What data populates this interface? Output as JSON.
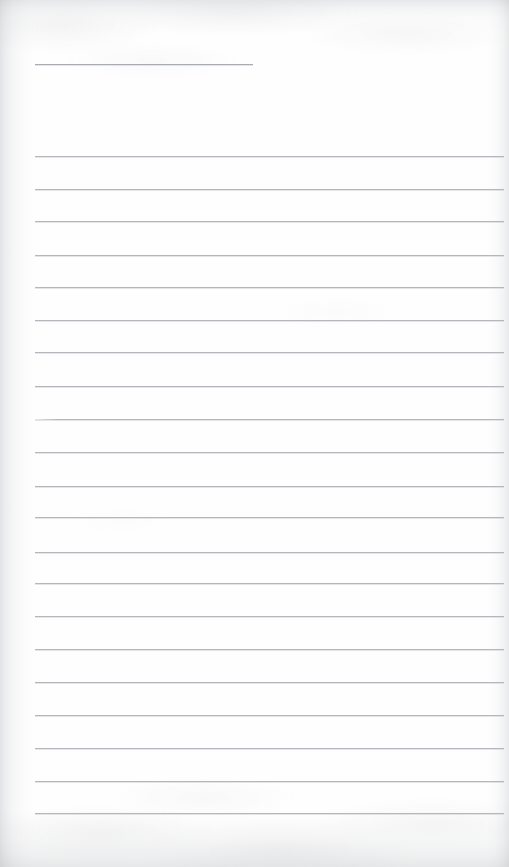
{
  "document": {
    "type": "scanned-lined-notebook-page",
    "title": "",
    "page_width": 509,
    "page_height": 867,
    "paper_color": "#fefefe",
    "rule_color": "#b4b8bc",
    "header_rule_color": "#a9adb2",
    "content_text": "",
    "handwriting_present": false,
    "notes": "Blank ruled page: one short header rule near the top followed by 21 full-width body rules."
  },
  "header_rule": {
    "name": "header-rule",
    "x": 35,
    "y": 64,
    "width": 218
  },
  "body_rules": {
    "count": 21,
    "start_x": 35,
    "end_x": 504,
    "first_y": 156,
    "spacing": 32.85,
    "lines": [
      {
        "index": 1,
        "y": 156,
        "x": 35,
        "width": 469,
        "faded_start": false
      },
      {
        "index": 2,
        "y": 189,
        "x": 35,
        "width": 469,
        "faded_start": false
      },
      {
        "index": 3,
        "y": 221,
        "x": 35,
        "width": 469,
        "faded_start": false
      },
      {
        "index": 4,
        "y": 255,
        "x": 35,
        "width": 469,
        "faded_start": false
      },
      {
        "index": 5,
        "y": 287,
        "x": 35,
        "width": 469,
        "faded_start": false
      },
      {
        "index": 6,
        "y": 320,
        "x": 35,
        "width": 469,
        "faded_start": false
      },
      {
        "index": 7,
        "y": 352,
        "x": 35,
        "width": 469,
        "faded_start": false
      },
      {
        "index": 8,
        "y": 386,
        "x": 35,
        "width": 469,
        "faded_start": false
      },
      {
        "index": 9,
        "y": 419,
        "x": 35,
        "width": 469,
        "faded_start": true
      },
      {
        "index": 10,
        "y": 452,
        "x": 35,
        "width": 469,
        "faded_start": false
      },
      {
        "index": 11,
        "y": 486,
        "x": 35,
        "width": 469,
        "faded_start": false
      },
      {
        "index": 12,
        "y": 517,
        "x": 35,
        "width": 469,
        "faded_start": false
      },
      {
        "index": 13,
        "y": 552,
        "x": 35,
        "width": 469,
        "faded_start": false
      },
      {
        "index": 14,
        "y": 583,
        "x": 35,
        "width": 469,
        "faded_start": false
      },
      {
        "index": 15,
        "y": 616,
        "x": 35,
        "width": 469,
        "faded_start": false
      },
      {
        "index": 16,
        "y": 649,
        "x": 35,
        "width": 469,
        "faded_start": false
      },
      {
        "index": 17,
        "y": 682,
        "x": 35,
        "width": 469,
        "faded_start": false
      },
      {
        "index": 18,
        "y": 715,
        "x": 35,
        "width": 469,
        "faded_start": false
      },
      {
        "index": 19,
        "y": 748,
        "x": 35,
        "width": 469,
        "faded_start": false
      },
      {
        "index": 20,
        "y": 781,
        "x": 35,
        "width": 469,
        "faded_start": false
      },
      {
        "index": 21,
        "y": 813,
        "x": 35,
        "width": 469,
        "faded_start": false
      }
    ]
  }
}
